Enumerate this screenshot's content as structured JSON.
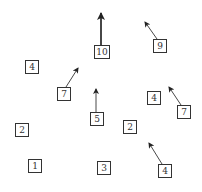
{
  "diagram": {
    "title": "",
    "boxes": [
      {
        "id": "b4a",
        "label": "4",
        "x": 25,
        "y": 60
      },
      {
        "id": "b10",
        "label": "10",
        "x": 94,
        "y": 45
      },
      {
        "id": "b9",
        "label": "9",
        "x": 153,
        "y": 39
      },
      {
        "id": "b7a",
        "label": "7",
        "x": 57,
        "y": 87
      },
      {
        "id": "b5",
        "label": "5",
        "x": 90,
        "y": 112
      },
      {
        "id": "b4b",
        "label": "4",
        "x": 147,
        "y": 91
      },
      {
        "id": "b7b",
        "label": "7",
        "x": 177,
        "y": 105
      },
      {
        "id": "b2a",
        "label": "2",
        "x": 15,
        "y": 123
      },
      {
        "id": "b2b",
        "label": "2",
        "x": 123,
        "y": 120
      },
      {
        "id": "b4c",
        "label": "4",
        "x": 158,
        "y": 164
      },
      {
        "id": "b1",
        "label": "1",
        "x": 28,
        "y": 159
      },
      {
        "id": "b3",
        "label": "3",
        "x": 97,
        "y": 161
      }
    ],
    "arrows": [
      {
        "from": "b10",
        "x1": 101,
        "y1": 45,
        "x2": 101,
        "y2": 13,
        "weight": 2
      },
      {
        "from": "b9",
        "x1": 157,
        "y1": 39,
        "x2": 145,
        "y2": 22,
        "weight": 1
      },
      {
        "from": "b7a",
        "x1": 66,
        "y1": 87,
        "x2": 78,
        "y2": 68,
        "weight": 1
      },
      {
        "from": "b5",
        "x1": 96,
        "y1": 112,
        "x2": 96,
        "y2": 89,
        "weight": 1
      },
      {
        "from": "b7b",
        "x1": 181,
        "y1": 105,
        "x2": 169,
        "y2": 87,
        "weight": 1
      },
      {
        "from": "b4c",
        "x1": 162,
        "y1": 164,
        "x2": 149,
        "y2": 143,
        "weight": 1
      }
    ],
    "colors": {
      "stroke": "#333333",
      "background": "#ffffff"
    }
  }
}
